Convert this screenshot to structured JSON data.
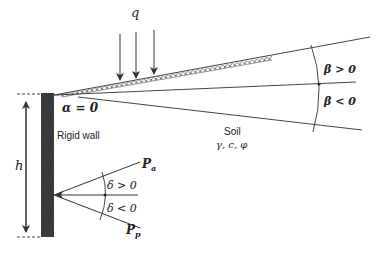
{
  "diagram": {
    "type": "retaining-wall-earth-pressure-schematic",
    "labels": {
      "surcharge": "q",
      "wall_angle": "α = 0",
      "wall": "Rigid wall",
      "height": "h",
      "soil": "Soil",
      "soil_params": "γ, c, φ",
      "beta_positive": "β > 0",
      "beta_negative": "β < 0",
      "active_force": "P",
      "active_sub": "a",
      "passive_force": "P",
      "passive_sub": "p",
      "delta_positive": "δ > 0",
      "delta_negative": "δ < 0"
    },
    "colors": {
      "line": "#3a3a3a",
      "wall": "#2b2b2b",
      "text": "#222222"
    }
  }
}
